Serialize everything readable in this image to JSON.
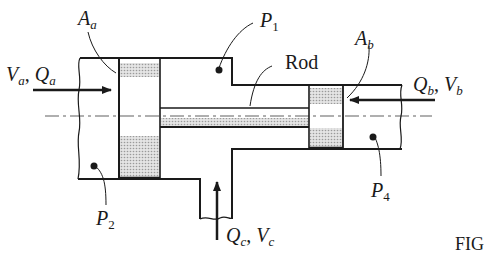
{
  "figure": {
    "caption_fragment": "FIG",
    "labels": {
      "Aa": {
        "main": "A",
        "sub": "a"
      },
      "Ab": {
        "main": "A",
        "sub": "b"
      },
      "P1": {
        "main": "P",
        "sub": "1"
      },
      "P2": {
        "main": "P",
        "sub": "2"
      },
      "P4": {
        "main": "P",
        "sub": "4"
      },
      "rod": "Rod",
      "inlet_a": {
        "v": "V",
        "v_sub": "a",
        "sep": ", ",
        "q": "Q",
        "q_sub": "a"
      },
      "inlet_b": {
        "q": "Q",
        "q_sub": "b",
        "sep": ", ",
        "v": "V",
        "v_sub": "b"
      },
      "inlet_c": {
        "q": "Q",
        "q_sub": "c",
        "sep": ", ",
        "v": "V",
        "v_sub": "c"
      }
    }
  },
  "colors": {
    "line": "#1a1a1a",
    "hatch": "#c8c8c8",
    "background": "#ffffff"
  }
}
